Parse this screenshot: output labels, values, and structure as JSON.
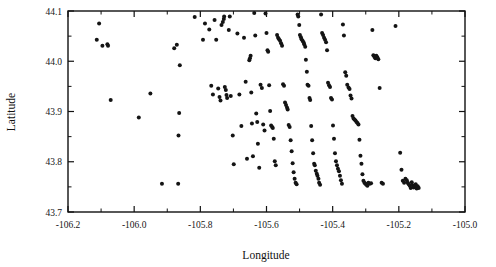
{
  "chart_data": {
    "type": "scatter",
    "title": "",
    "subtitle": "",
    "xlabel": "Longitude",
    "ylabel": "Latitude",
    "xlim": [
      -106.2,
      -105.0
    ],
    "ylim": [
      43.7,
      44.1
    ],
    "grid": false,
    "legend": null,
    "x_ticks": [
      -106.2,
      -106.0,
      -105.8,
      -105.6,
      -105.4,
      -105.2,
      -105.0
    ],
    "x_tick_labels": [
      "-106.2",
      "-106.0",
      "-105.8",
      "-105.6",
      "-105.4",
      "-105.2",
      "-105.0"
    ],
    "x_minor_ticks": [
      -106.1,
      -105.9,
      -105.7,
      -105.5,
      -105.3,
      -105.1
    ],
    "y_ticks": [
      43.7,
      43.8,
      43.9,
      44.0,
      44.1
    ],
    "y_tick_labels": [
      "43.7",
      "43.8",
      "43.9",
      "44.0",
      "44.1"
    ],
    "y_minor_ticks": [
      43.75,
      43.85,
      43.95,
      44.05
    ],
    "marker": "dot",
    "marker_color": "#141414",
    "marker_size": 2.0,
    "n_points": 196,
    "points": [
      [
        -106.106,
        44.075
      ],
      [
        -106.113,
        44.043
      ],
      [
        -106.096,
        44.031
      ],
      [
        -106.081,
        44.034
      ],
      [
        -106.079,
        44.031
      ],
      [
        -106.071,
        43.923
      ],
      [
        -105.986,
        43.888
      ],
      [
        -105.951,
        43.936
      ],
      [
        -105.916,
        43.756
      ],
      [
        -105.879,
        44.026
      ],
      [
        -105.871,
        44.033
      ],
      [
        -105.862,
        43.992
      ],
      [
        -105.864,
        43.897
      ],
      [
        -105.866,
        43.852
      ],
      [
        -105.867,
        43.756
      ],
      [
        -105.817,
        44.088
      ],
      [
        -105.792,
        44.043
      ],
      [
        -105.786,
        44.075
      ],
      [
        -105.773,
        44.063
      ],
      [
        -105.767,
        43.951
      ],
      [
        -105.762,
        43.934
      ],
      [
        -105.757,
        44.082
      ],
      [
        -105.752,
        44.043
      ],
      [
        -105.746,
        43.946
      ],
      [
        -105.742,
        43.929
      ],
      [
        -105.739,
        43.922
      ],
      [
        -105.736,
        44.072
      ],
      [
        -105.732,
        44.078
      ],
      [
        -105.729,
        44.084
      ],
      [
        -105.728,
        44.089
      ],
      [
        -105.726,
        43.949
      ],
      [
        -105.723,
        43.943
      ],
      [
        -105.721,
        43.933
      ],
      [
        -105.719,
        43.927
      ],
      [
        -105.714,
        44.062
      ],
      [
        -105.711,
        44.089
      ],
      [
        -105.708,
        43.931
      ],
      [
        -105.702,
        43.852
      ],
      [
        -105.699,
        43.795
      ],
      [
        -105.688,
        44.055
      ],
      [
        -105.682,
        43.934
      ],
      [
        -105.676,
        43.871
      ],
      [
        -105.668,
        44.047
      ],
      [
        -105.663,
        43.959
      ],
      [
        -105.659,
        43.806
      ],
      [
        -105.652,
        44.002
      ],
      [
        -105.65,
        44.006
      ],
      [
        -105.648,
        44.011
      ],
      [
        -105.646,
        43.938
      ],
      [
        -105.644,
        43.876
      ],
      [
        -105.641,
        43.811
      ],
      [
        -105.637,
        44.096
      ],
      [
        -105.634,
        44.051
      ],
      [
        -105.631,
        43.896
      ],
      [
        -105.628,
        43.879
      ],
      [
        -105.626,
        43.836
      ],
      [
        -105.622,
        43.788
      ],
      [
        -105.618,
        43.953
      ],
      [
        -105.614,
        43.947
      ],
      [
        -105.61,
        43.874
      ],
      [
        -105.606,
        43.862
      ],
      [
        -105.603,
        44.095
      ],
      [
        -105.6,
        44.056
      ],
      [
        -105.597,
        44.022
      ],
      [
        -105.595,
        44.019
      ],
      [
        -105.592,
        43.952
      ],
      [
        -105.589,
        43.901
      ],
      [
        -105.586,
        43.872
      ],
      [
        -105.583,
        43.869
      ],
      [
        -105.581,
        43.867
      ],
      [
        -105.578,
        43.846
      ],
      [
        -105.575,
        43.801
      ],
      [
        -105.572,
        43.793
      ],
      [
        -105.568,
        44.052
      ],
      [
        -105.565,
        44.047
      ],
      [
        -105.562,
        44.044
      ],
      [
        -105.559,
        44.041
      ],
      [
        -105.556,
        44.036
      ],
      [
        -105.553,
        44.031
      ],
      [
        -105.55,
        43.954
      ],
      [
        -105.547,
        43.951
      ],
      [
        -105.544,
        43.918
      ],
      [
        -105.541,
        43.913
      ],
      [
        -105.538,
        43.908
      ],
      [
        -105.536,
        43.904
      ],
      [
        -105.533,
        43.873
      ],
      [
        -105.53,
        43.869
      ],
      [
        -105.527,
        43.843
      ],
      [
        -105.524,
        43.821
      ],
      [
        -105.521,
        43.797
      ],
      [
        -105.518,
        43.779
      ],
      [
        -105.515,
        43.766
      ],
      [
        -105.512,
        43.758
      ],
      [
        -105.509,
        43.755
      ],
      [
        -105.506,
        44.093
      ],
      [
        -105.504,
        44.089
      ],
      [
        -105.501,
        44.072
      ],
      [
        -105.499,
        44.052
      ],
      [
        -105.496,
        44.048
      ],
      [
        -105.494,
        44.044
      ],
      [
        -105.491,
        44.041
      ],
      [
        -105.488,
        44.038
      ],
      [
        -105.486,
        44.034
      ],
      [
        -105.483,
        44.029
      ],
      [
        -105.481,
        44.003
      ],
      [
        -105.478,
        43.979
      ],
      [
        -105.476,
        43.953
      ],
      [
        -105.473,
        43.951
      ],
      [
        -105.47,
        43.927
      ],
      [
        -105.468,
        43.923
      ],
      [
        -105.465,
        43.871
      ],
      [
        -105.462,
        43.843
      ],
      [
        -105.459,
        43.817
      ],
      [
        -105.456,
        43.796
      ],
      [
        -105.454,
        43.793
      ],
      [
        -105.451,
        43.782
      ],
      [
        -105.448,
        43.776
      ],
      [
        -105.446,
        43.772
      ],
      [
        -105.443,
        43.766
      ],
      [
        -105.441,
        43.758
      ],
      [
        -105.438,
        43.754
      ],
      [
        -105.435,
        44.093
      ],
      [
        -105.432,
        44.056
      ],
      [
        -105.429,
        44.052
      ],
      [
        -105.426,
        44.047
      ],
      [
        -105.423,
        44.043
      ],
      [
        -105.42,
        44.038
      ],
      [
        -105.417,
        44.022
      ],
      [
        -105.414,
        43.957
      ],
      [
        -105.411,
        43.952
      ],
      [
        -105.408,
        43.949
      ],
      [
        -105.405,
        43.927
      ],
      [
        -105.402,
        43.924
      ],
      [
        -105.399,
        43.872
      ],
      [
        -105.396,
        43.846
      ],
      [
        -105.393,
        43.817
      ],
      [
        -105.39,
        43.801
      ],
      [
        -105.387,
        43.793
      ],
      [
        -105.384,
        43.786
      ],
      [
        -105.381,
        43.781
      ],
      [
        -105.378,
        43.772
      ],
      [
        -105.375,
        43.763
      ],
      [
        -105.372,
        43.756
      ],
      [
        -105.369,
        44.073
      ],
      [
        -105.366,
        44.051
      ],
      [
        -105.362,
        43.978
      ],
      [
        -105.359,
        43.971
      ],
      [
        -105.356,
        43.953
      ],
      [
        -105.352,
        43.948
      ],
      [
        -105.349,
        43.945
      ],
      [
        -105.346,
        43.932
      ],
      [
        -105.343,
        43.926
      ],
      [
        -105.34,
        43.891
      ],
      [
        -105.337,
        43.886
      ],
      [
        -105.334,
        43.884
      ],
      [
        -105.331,
        43.882
      ],
      [
        -105.328,
        43.879
      ],
      [
        -105.325,
        43.877
      ],
      [
        -105.322,
        43.874
      ],
      [
        -105.319,
        43.844
      ],
      [
        -105.316,
        43.812
      ],
      [
        -105.313,
        43.796
      ],
      [
        -105.31,
        43.775
      ],
      [
        -105.307,
        43.762
      ],
      [
        -105.304,
        43.758
      ],
      [
        -105.301,
        43.756
      ],
      [
        -105.298,
        43.754
      ],
      [
        -105.295,
        43.752
      ],
      [
        -105.292,
        43.758
      ],
      [
        -105.288,
        43.756
      ],
      [
        -105.284,
        43.757
      ],
      [
        -105.28,
        44.062
      ],
      [
        -105.277,
        44.012
      ],
      [
        -105.274,
        44.009
      ],
      [
        -105.271,
        44.006
      ],
      [
        -105.268,
        44.011
      ],
      [
        -105.265,
        44.008
      ],
      [
        -105.262,
        44.004
      ],
      [
        -105.258,
        43.947
      ],
      [
        -105.252,
        43.758
      ],
      [
        -105.248,
        43.756
      ],
      [
        -105.21,
        44.07
      ],
      [
        -105.196,
        43.818
      ],
      [
        -105.192,
        43.784
      ],
      [
        -105.188,
        43.762
      ],
      [
        -105.184,
        43.758
      ],
      [
        -105.18,
        43.766
      ],
      [
        -105.176,
        43.763
      ],
      [
        -105.173,
        43.758
      ],
      [
        -105.17,
        43.755
      ],
      [
        -105.167,
        43.752
      ],
      [
        -105.164,
        43.748
      ],
      [
        -105.161,
        43.759
      ],
      [
        -105.158,
        43.753
      ],
      [
        -105.155,
        43.749
      ],
      [
        -105.152,
        43.752
      ],
      [
        -105.149,
        43.755
      ],
      [
        -105.146,
        43.747
      ],
      [
        -105.143,
        43.751
      ],
      [
        -105.14,
        43.748
      ]
    ]
  },
  "axes": {
    "x_title": "Longitude",
    "y_title": "Latitude"
  }
}
